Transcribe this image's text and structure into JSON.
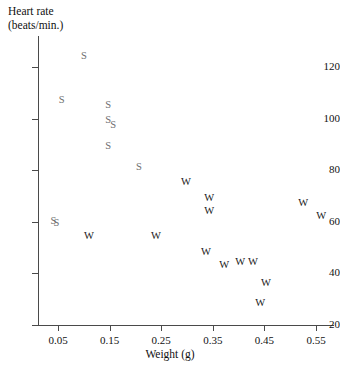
{
  "chart_data": {
    "type": "scatter",
    "title": "",
    "xlabel": "Weight (g)",
    "ylabel": "Heart rate (beats/min.)",
    "ylabel_line1": "Heart rate",
    "ylabel_line2": "(beats/min.)",
    "xlim": [
      0.02,
      0.59
    ],
    "ylim": [
      20,
      132
    ],
    "xticks": [
      0.05,
      0.15,
      0.25,
      0.35,
      0.45,
      0.55
    ],
    "xtick_labels": [
      "0.05",
      "0.15",
      "0.25",
      "0.35",
      "0.45",
      "0.55"
    ],
    "yticks": [
      20,
      40,
      60,
      80,
      100,
      120
    ],
    "ytick_labels": [
      "20",
      "40",
      "60",
      "80",
      "100",
      "120"
    ],
    "grid": false,
    "legend": "none",
    "marker_style": "text-letter",
    "series": [
      {
        "name": "S",
        "marker": "S",
        "color": "#6e6e6e",
        "points": [
          {
            "x": 0.1,
            "y": 124
          },
          {
            "x": 0.057,
            "y": 107
          },
          {
            "x": 0.147,
            "y": 105
          },
          {
            "x": 0.147,
            "y": 99
          },
          {
            "x": 0.157,
            "y": 97
          },
          {
            "x": 0.147,
            "y": 89
          },
          {
            "x": 0.207,
            "y": 81
          },
          {
            "x": 0.041,
            "y": 60
          },
          {
            "x": 0.047,
            "y": 59
          }
        ]
      },
      {
        "name": "W",
        "marker": "W",
        "color": "#202020",
        "points": [
          {
            "x": 0.298,
            "y": 75
          },
          {
            "x": 0.343,
            "y": 69
          },
          {
            "x": 0.343,
            "y": 64
          },
          {
            "x": 0.525,
            "y": 67
          },
          {
            "x": 0.56,
            "y": 62
          },
          {
            "x": 0.11,
            "y": 54
          },
          {
            "x": 0.24,
            "y": 54
          },
          {
            "x": 0.337,
            "y": 48
          },
          {
            "x": 0.372,
            "y": 43
          },
          {
            "x": 0.403,
            "y": 44
          },
          {
            "x": 0.428,
            "y": 44
          },
          {
            "x": 0.453,
            "y": 36
          },
          {
            "x": 0.442,
            "y": 28
          }
        ]
      }
    ]
  },
  "axes": {
    "x_title": "Weight (g)",
    "y_title_line1": "Heart rate",
    "y_title_line2": "(beats/min.)"
  }
}
